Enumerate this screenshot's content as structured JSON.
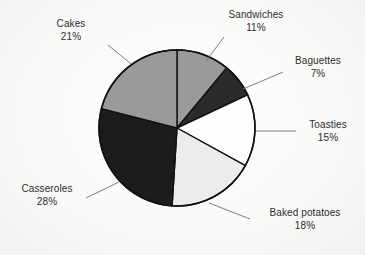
{
  "figure": {
    "background_color": "#fbfbfa",
    "text_color": "#2d2d2d",
    "outline_color": "#111111"
  },
  "chart_data": {
    "type": "pie",
    "title": "",
    "subtitle": "",
    "xlabel": "",
    "ylabel": "",
    "legend_position": "none",
    "grid": false,
    "labels_outside": true,
    "leader_lines": true,
    "start_angle_deg": 0,
    "direction": "clockwise",
    "units": "percent",
    "total": 100,
    "categories": [
      "Sandwiches",
      "Baguettes",
      "Toasties",
      "Baked potatoes",
      "Casseroles",
      "Cakes"
    ],
    "values": [
      11,
      7,
      15,
      18,
      28,
      21
    ],
    "slices": [
      {
        "name": "Sandwiches",
        "value": 11,
        "value_text": "11%",
        "color": "#9a9a9a",
        "start_deg": 0,
        "end_deg": 39.6
      },
      {
        "name": "Baguettes",
        "value": 7,
        "value_text": "7%",
        "color": "#2b2b2b",
        "start_deg": 39.6,
        "end_deg": 64.8
      },
      {
        "name": "Toasties",
        "value": 15,
        "value_text": "15%",
        "color": "#fdfdfd",
        "start_deg": 64.8,
        "end_deg": 118.8
      },
      {
        "name": "Baked potatoes",
        "value": 18,
        "value_text": "18%",
        "color": "#ececec",
        "start_deg": 118.8,
        "end_deg": 183.6
      },
      {
        "name": "Casseroles",
        "value": 28,
        "value_text": "28%",
        "color": "#1c1c1c",
        "start_deg": 183.6,
        "end_deg": 284.4
      },
      {
        "name": "Cakes",
        "value": 21,
        "value_text": "21%",
        "color": "#9a9a9a",
        "start_deg": 284.4,
        "end_deg": 360
      }
    ]
  },
  "labels": {
    "cakes": {
      "name": "Cakes",
      "pct": "21%"
    },
    "sandwiches": {
      "name": "Sandwiches",
      "pct": "11%"
    },
    "baguettes": {
      "name": "Baguettes",
      "pct": "7%"
    },
    "toasties": {
      "name": "Toasties",
      "pct": "15%"
    },
    "baked_potatoes": {
      "name": "Baked potatoes",
      "pct": "18%"
    },
    "casseroles": {
      "name": "Casseroles",
      "pct": "28%"
    }
  }
}
